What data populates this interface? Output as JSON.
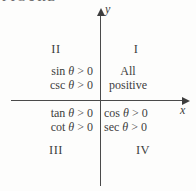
{
  "figure": {
    "clipped_caption": "FIGURE"
  },
  "axes": {
    "x_label": "x",
    "y_label": "y"
  },
  "quadrants": {
    "q1": {
      "numeral": "I",
      "line1": "All",
      "line2": "positive"
    },
    "q2": {
      "numeral": "II",
      "lines": [
        {
          "fn": "sin",
          "theta": "θ",
          "rest": "> 0"
        },
        {
          "fn": "csc",
          "theta": "θ",
          "rest": "> 0"
        }
      ]
    },
    "q3": {
      "numeral": "III",
      "lines": [
        {
          "fn": "tan",
          "theta": "θ",
          "rest": "> 0"
        },
        {
          "fn": "cot",
          "theta": "θ",
          "rest": "> 0"
        }
      ]
    },
    "q4": {
      "numeral": "IV",
      "lines": [
        {
          "fn": "cos",
          "theta": "θ",
          "rest": "> 0"
        },
        {
          "fn": "sec",
          "theta": "θ",
          "rest": "> 0"
        }
      ]
    }
  },
  "colors": {
    "ink": "#3e3e3e",
    "axis": "#4a4a4a",
    "background": "#fdfdfc"
  }
}
